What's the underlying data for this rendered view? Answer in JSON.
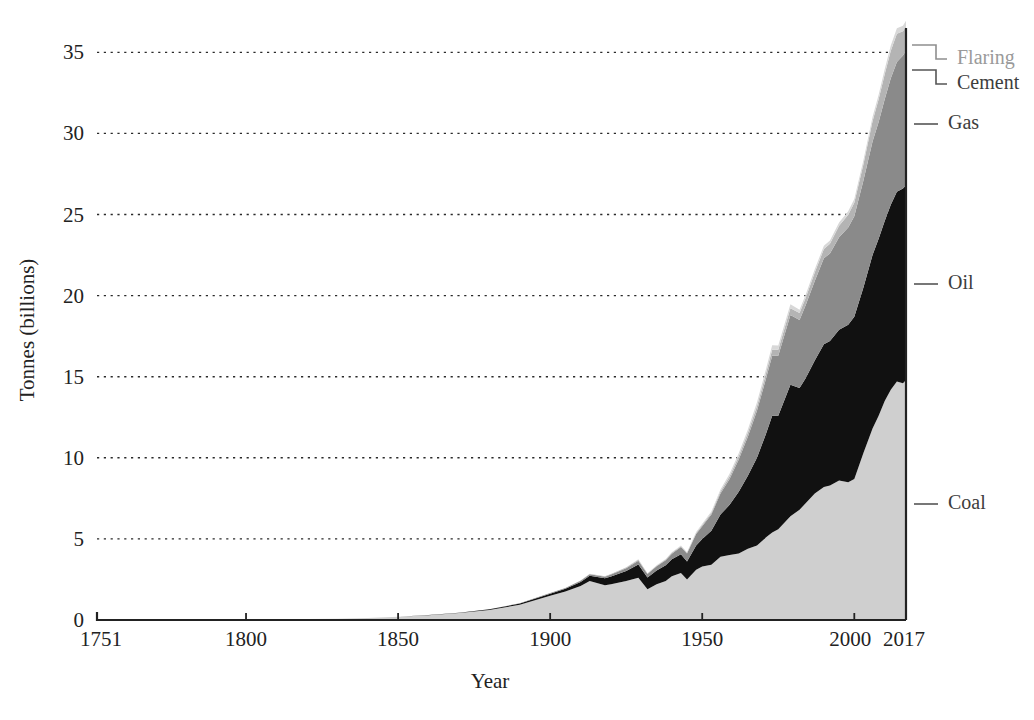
{
  "chart_data": {
    "type": "area",
    "stacked": true,
    "title": "",
    "subtitle": "",
    "xlabel": "Year",
    "ylabel": "Tonnes (billions)",
    "xlim": [
      1751,
      2017
    ],
    "ylim": [
      0,
      36.5
    ],
    "grid": true,
    "grid_axis": "y",
    "legend_position": "right-inline-leader-lines",
    "x_ticks": [
      "1751",
      "1800",
      "1850",
      "1900",
      "1950",
      "2000",
      "2017"
    ],
    "x_tick_values": [
      1751,
      1800,
      1850,
      1900,
      1950,
      2000,
      2017
    ],
    "y_ticks": [
      "0",
      "5",
      "10",
      "15",
      "20",
      "25",
      "30",
      "35"
    ],
    "y_tick_values": [
      0,
      5,
      10,
      15,
      20,
      25,
      30,
      35
    ],
    "stack_order_bottom_to_top": [
      "Coal",
      "Oil",
      "Gas",
      "Cement",
      "Flaring"
    ],
    "colors": {
      "Coal": "#cfcfcf",
      "Oil": "#111111",
      "Gas": "#8a8a8a",
      "Cement": "#b4b4b4",
      "Flaring": "#d8d8d8",
      "axis": "#222222",
      "grid": "#2a2a2a",
      "text": "#222222",
      "legend_text": "#3d3d3d",
      "legend_text_faint": "#9a9a9a"
    },
    "x": [
      1751,
      1760,
      1770,
      1780,
      1790,
      1800,
      1810,
      1820,
      1830,
      1840,
      1850,
      1860,
      1870,
      1880,
      1890,
      1900,
      1905,
      1910,
      1913,
      1918,
      1920,
      1925,
      1929,
      1932,
      1935,
      1938,
      1940,
      1943,
      1945,
      1948,
      1950,
      1953,
      1956,
      1959,
      1962,
      1965,
      1968,
      1971,
      1973,
      1975,
      1979,
      1982,
      1984,
      1987,
      1990,
      1992,
      1995,
      1998,
      2000,
      2003,
      2006,
      2008,
      2010,
      2012,
      2014,
      2016,
      2017
    ],
    "series": [
      {
        "name": "Coal",
        "values": [
          0.01,
          0.01,
          0.01,
          0.02,
          0.03,
          0.03,
          0.05,
          0.06,
          0.08,
          0.13,
          0.2,
          0.3,
          0.43,
          0.62,
          0.94,
          1.5,
          1.75,
          2.1,
          2.4,
          2.15,
          2.2,
          2.4,
          2.6,
          1.9,
          2.2,
          2.4,
          2.7,
          2.9,
          2.5,
          3.1,
          3.3,
          3.4,
          3.9,
          4.0,
          4.1,
          4.4,
          4.6,
          5.1,
          5.4,
          5.6,
          6.4,
          6.8,
          7.2,
          7.8,
          8.2,
          8.3,
          8.6,
          8.5,
          8.7,
          10.3,
          11.8,
          12.6,
          13.5,
          14.2,
          14.7,
          14.6,
          14.8
        ]
      },
      {
        "name": "Oil",
        "values": [
          0,
          0,
          0,
          0,
          0,
          0,
          0,
          0,
          0,
          0,
          0,
          0.01,
          0.02,
          0.04,
          0.07,
          0.12,
          0.17,
          0.25,
          0.33,
          0.42,
          0.48,
          0.62,
          0.82,
          0.72,
          0.85,
          0.98,
          1.05,
          1.15,
          1.1,
          1.5,
          1.7,
          2.1,
          2.6,
          3.1,
          3.8,
          4.5,
          5.4,
          6.4,
          7.2,
          7.0,
          8.1,
          7.5,
          7.7,
          8.2,
          8.8,
          8.9,
          9.3,
          9.7,
          10.0,
          10.2,
          10.7,
          10.9,
          11.1,
          11.4,
          11.7,
          12.0,
          12.0
        ]
      },
      {
        "name": "Gas",
        "values": [
          0,
          0,
          0,
          0,
          0,
          0,
          0,
          0,
          0,
          0,
          0,
          0,
          0.0,
          0.01,
          0.02,
          0.04,
          0.05,
          0.07,
          0.09,
          0.1,
          0.12,
          0.17,
          0.24,
          0.21,
          0.26,
          0.3,
          0.34,
          0.45,
          0.5,
          0.7,
          0.78,
          1.0,
          1.3,
          1.6,
          2.0,
          2.4,
          2.9,
          3.4,
          3.7,
          3.7,
          4.3,
          4.2,
          4.5,
          4.9,
          5.3,
          5.4,
          5.7,
          6.0,
          6.2,
          6.6,
          7.0,
          7.2,
          7.5,
          7.8,
          8.0,
          8.2,
          8.3
        ]
      },
      {
        "name": "Cement",
        "values": [
          0,
          0,
          0,
          0,
          0,
          0,
          0,
          0,
          0,
          0,
          0,
          0,
          0,
          0.0,
          0.0,
          0.01,
          0.01,
          0.02,
          0.02,
          0.02,
          0.03,
          0.04,
          0.05,
          0.03,
          0.04,
          0.05,
          0.05,
          0.05,
          0.04,
          0.07,
          0.08,
          0.1,
          0.13,
          0.16,
          0.2,
          0.24,
          0.28,
          0.33,
          0.36,
          0.36,
          0.42,
          0.43,
          0.46,
          0.52,
          0.57,
          0.6,
          0.7,
          0.78,
          0.83,
          1.0,
          1.25,
          1.4,
          1.55,
          1.7,
          1.75,
          1.5,
          1.5
        ]
      },
      {
        "name": "Flaring",
        "values": [
          0,
          0,
          0,
          0,
          0,
          0,
          0,
          0,
          0,
          0,
          0,
          0,
          0,
          0,
          0,
          0.0,
          0.0,
          0.0,
          0.01,
          0.01,
          0.01,
          0.02,
          0.03,
          0.02,
          0.03,
          0.03,
          0.04,
          0.04,
          0.04,
          0.06,
          0.07,
          0.09,
          0.12,
          0.15,
          0.18,
          0.21,
          0.24,
          0.26,
          0.28,
          0.26,
          0.24,
          0.2,
          0.19,
          0.2,
          0.21,
          0.2,
          0.21,
          0.22,
          0.23,
          0.25,
          0.27,
          0.28,
          0.3,
          0.32,
          0.33,
          0.34,
          0.35
        ]
      }
    ],
    "legend_entries": [
      {
        "label": "Flaring",
        "faint": true
      },
      {
        "label": "Cement",
        "faint": false
      },
      {
        "label": "Gas",
        "faint": false
      },
      {
        "label": "Oil",
        "faint": false
      },
      {
        "label": "Coal",
        "faint": false
      }
    ],
    "total_2017": 36.15
  }
}
